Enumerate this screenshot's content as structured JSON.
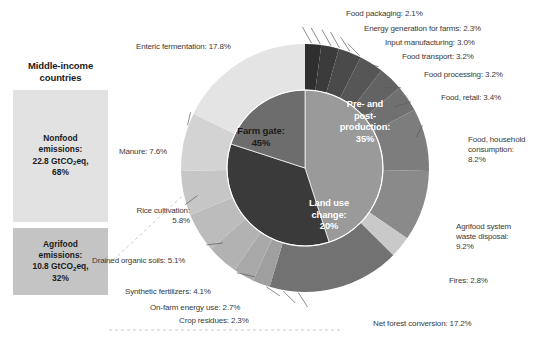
{
  "panel": {
    "title": "Middle-income countries",
    "segments": [
      {
        "name": "nonfood",
        "label_line1": "Nonfood",
        "label_line2": "emissions:",
        "value": "22.8 GtCO",
        "value_sub": "2",
        "value_tail": "eq,",
        "share": "68%",
        "color": "#e2e2e2"
      },
      {
        "name": "agrifood",
        "label_line1": "Agrifood",
        "label_line2": "emissions:",
        "value": "10.8 GtCO",
        "value_sub": "2",
        "value_tail": "eq,",
        "share": "32%",
        "color": "#c4c4c4"
      }
    ]
  },
  "chart_data": {
    "type": "pie",
    "title": "",
    "rings": [
      {
        "name": "inner",
        "categories": [
          "Farm gate",
          "Pre- and post-production",
          "Land use change"
        ],
        "values": [
          45,
          35,
          20
        ],
        "labels": [
          "Farm gate: 45%",
          "Pre- and post-production: 35%",
          "Land use change: 20%"
        ],
        "colors": [
          "#9a9a9a",
          "#3a3a3a",
          "#6d6d6d"
        ]
      },
      {
        "name": "outer",
        "categories": [
          "Food packaging",
          "Energy generation for farms",
          "Input manufacturing",
          "Food transport",
          "Food processing",
          "Food, retail",
          "Food, household consumption",
          "Agrifood system waste disposal",
          "Fires",
          "Net forest conversion",
          "Crop residues",
          "On-farm energy use",
          "Synthetic fertilizers",
          "Drained organic soils",
          "Rice cultivation",
          "Manure",
          "Enteric fermentation"
        ],
        "values": [
          2.1,
          2.3,
          3.0,
          3.2,
          3.2,
          3.4,
          8.2,
          9.2,
          2.8,
          17.2,
          2.3,
          2.7,
          4.1,
          5.1,
          5.8,
          7.6,
          17.8
        ],
        "colors": [
          "#2f2f2f",
          "#3b3b3b",
          "#4a4a4a",
          "#565656",
          "#636363",
          "#707070",
          "#7d7d7d",
          "#8a8a8a",
          "#c9c9c9",
          "#727272",
          "#9f9f9f",
          "#a8a8a8",
          "#b2b2b2",
          "#bcbcbc",
          "#c6c6c6",
          "#d3d3d3",
          "#e4e4e4"
        ]
      }
    ]
  },
  "callouts": {
    "enteric_fermentation": "Enteric fermentation: 17.8%",
    "manure": "Manure: 7.6%",
    "rice_cultivation_l1": "Rice cultivation:",
    "rice_cultivation_l2": "5.8%",
    "drained_organic_soils": "Drained organic soils: 5.1%",
    "synthetic_fertilizers": "Synthetic fertilizers: 4.1%",
    "on_farm_energy_use": "On-farm energy use: 2.7%",
    "crop_residues": "Crop residues: 2.3%",
    "food_packaging": "Food packaging: 2.1%",
    "energy_generation_for_farms": "Energy generation for farms: 2.3%",
    "input_manufacturing": "Input manufacturing: 3.0%",
    "food_transport": "Food transport: 3.2%",
    "food_processing": "Food processing: 3.2%",
    "food_retail": "Food, retail: 3.4%",
    "food_household_consumption_l1": "Food, household",
    "food_household_consumption_l2": "consumption:",
    "food_household_consumption_l3": "8.2%",
    "agrifood_waste_disposal_l1": "Agrifood system",
    "agrifood_waste_disposal_l2": "waste disposal:",
    "agrifood_waste_disposal_l3": "9.2%",
    "fires": "Fires: 2.8%",
    "net_forest_conversion": "Net forest conversion: 17.2%"
  },
  "center_labels": {
    "farm_gate_l1": "Farm gate:",
    "farm_gate_l2": "45%",
    "pre_post_l1": "Pre- and",
    "pre_post_l2": "post-",
    "pre_post_l3": "production:",
    "pre_post_l4": "35%",
    "land_use_l1": "Land use",
    "land_use_l2": "change:",
    "land_use_l3": "20%"
  }
}
